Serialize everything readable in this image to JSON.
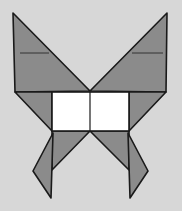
{
  "diagram": {
    "colors": {
      "background": "#d7d7d7",
      "fill": "#8b8b8b",
      "body": "#ffffff",
      "stroke": "#1a1a1a"
    },
    "pieces": [
      {
        "name": "upper-left-wing",
        "points": "13,13 15,92 90,91"
      },
      {
        "name": "upper-right-wing",
        "points": "167,13 166,92 90,91"
      },
      {
        "name": "left-corner-triangle",
        "points": "15,92 52,92 52,131"
      },
      {
        "name": "right-corner-triangle",
        "points": "166,92 129,92 129,131"
      },
      {
        "name": "lower-left-triangle",
        "points": "52,131 90,131 52,170"
      },
      {
        "name": "lower-right-triangle",
        "points": "129,131 90,131 129,170"
      },
      {
        "name": "left-tail",
        "points": "53,133 33,171 51,198"
      },
      {
        "name": "right-tail",
        "points": "128,133 148,171 130,198"
      }
    ],
    "body": {
      "x": 52,
      "y": 92,
      "width": 77,
      "height": 39,
      "divider_x": 90
    },
    "wing_lines": [
      {
        "x1": 20,
        "y1": 53,
        "x2": 49,
        "y2": 53
      },
      {
        "x1": 132,
        "y1": 53,
        "x2": 163,
        "y2": 53
      }
    ]
  }
}
